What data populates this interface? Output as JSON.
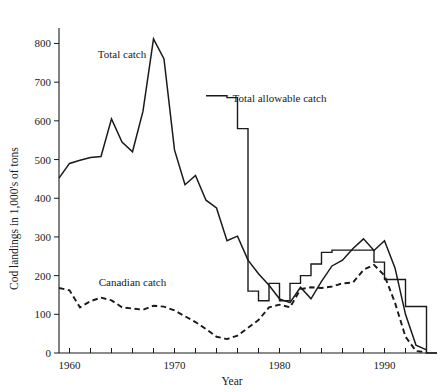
{
  "chart_data": {
    "type": "line",
    "title": "",
    "xlabel": "Year",
    "ylabel": "Cod landings in 1,000's of tons",
    "xlim": [
      1959,
      1995
    ],
    "ylim": [
      0,
      840
    ],
    "grid": false,
    "legend_position": "inline-annotations",
    "x_ticks_major": [
      1960,
      1970,
      1980,
      1990
    ],
    "x_tick_labels": [
      "1960",
      "1970",
      "1980",
      "1990"
    ],
    "x_ticks_minor_step": 2,
    "y_ticks": [
      0,
      100,
      200,
      300,
      400,
      500,
      600,
      700,
      800
    ],
    "y_tick_labels": [
      "0",
      "100",
      "200",
      "300",
      "400",
      "500",
      "600",
      "700",
      "800"
    ],
    "series": [
      {
        "name": "Total catch",
        "style": "solid",
        "label_x": 1965.0,
        "label_y": 762,
        "x": [
          1959,
          1960,
          1961,
          1962,
          1963,
          1964,
          1965,
          1966,
          1967,
          1968,
          1969,
          1970,
          1971,
          1972,
          1973,
          1974,
          1975,
          1976,
          1977,
          1978,
          1979,
          1980,
          1981,
          1982,
          1983,
          1984,
          1985,
          1986,
          1987,
          1988,
          1989,
          1990,
          1991,
          1992,
          1993,
          1994
        ],
        "values": [
          452,
          490,
          498,
          505,
          508,
          605,
          545,
          520,
          625,
          812,
          760,
          525,
          435,
          459,
          395,
          375,
          290,
          302,
          240,
          205,
          175,
          140,
          130,
          170,
          140,
          185,
          225,
          240,
          270,
          295,
          265,
          290,
          220,
          100,
          20,
          8
        ]
      },
      {
        "name": "Total allowable catch",
        "style": "step",
        "label_x": 1980.0,
        "label_y": 648,
        "x": [
          1973,
          1974,
          1975,
          1976,
          1977,
          1978,
          1979,
          1980,
          1981,
          1982,
          1983,
          1984,
          1985,
          1986,
          1987,
          1988,
          1989,
          1990,
          1991,
          1992,
          1993,
          1994
        ],
        "values": [
          665,
          665,
          660,
          580,
          160,
          135,
          180,
          135,
          180,
          200,
          230,
          260,
          266,
          266,
          266,
          266,
          235,
          190,
          190,
          120,
          120,
          0
        ]
      },
      {
        "name": "Canadian catch",
        "style": "dashed",
        "label_x": 1966.0,
        "label_y": 172,
        "x": [
          1959,
          1960,
          1961,
          1962,
          1963,
          1964,
          1965,
          1966,
          1967,
          1968,
          1969,
          1970,
          1971,
          1972,
          1973,
          1974,
          1975,
          1976,
          1977,
          1978,
          1979,
          1980,
          1981,
          1982,
          1983,
          1984,
          1985,
          1986,
          1987,
          1988,
          1989,
          1990,
          1991,
          1992,
          1993,
          1994
        ],
        "values": [
          168,
          162,
          118,
          134,
          143,
          136,
          118,
          115,
          112,
          122,
          120,
          110,
          95,
          80,
          62,
          42,
          36,
          45,
          65,
          85,
          118,
          125,
          118,
          165,
          170,
          168,
          172,
          180,
          182,
          215,
          228,
          200,
          130,
          42,
          5,
          2
        ]
      }
    ]
  },
  "annotations": {
    "total_catch_label": "Total catch",
    "tac_label": "Total allowable catch",
    "canadian_catch_label": "Canadian catch"
  },
  "axes": {
    "y_axis_title": "Cod landings in 1,000's of tons",
    "x_axis_title": "Year"
  }
}
